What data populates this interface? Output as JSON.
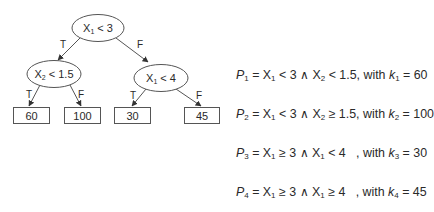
{
  "diagram": {
    "type": "decision-tree",
    "nodes": {
      "root": {
        "var": "X",
        "sub": "1",
        "op": " < ",
        "val": "3"
      },
      "left": {
        "var": "X",
        "sub": "2",
        "op": " < ",
        "val": "1.5"
      },
      "right": {
        "var": "X",
        "sub": "1",
        "op": " < ",
        "val": "4"
      }
    },
    "edges": {
      "root_left": "T",
      "root_right": "F",
      "left_left": "T",
      "left_right": "F",
      "right_left": "T",
      "right_right": "F"
    },
    "leaves": [
      "60",
      "100",
      "30",
      "45"
    ],
    "colors": {
      "stroke": "#555555",
      "text": "#2a2a2a"
    }
  },
  "rules": [
    {
      "p": "P",
      "pi": "1",
      "eq": " = X",
      "a": "1",
      "c1": " < 3 ∧ X",
      "b": "2",
      "c2": " < 1.5",
      "w": ", with ",
      "k": "k",
      "ki": "1",
      "kv": " = 60"
    },
    {
      "p": "P",
      "pi": "2",
      "eq": " = X",
      "a": "1",
      "c1": " < 3 ∧ X",
      "b": "2",
      "c2": " ≥ 1.5",
      "w": ", with ",
      "k": "k",
      "ki": "2",
      "kv": " = 100"
    },
    {
      "p": "P",
      "pi": "3",
      "eq": " = X",
      "a": "1",
      "c1": " ≥ 3 ∧ X",
      "b": "1",
      "c2": " < 4   ",
      "w": ", with ",
      "k": "k",
      "ki": "3",
      "kv": " = 30"
    },
    {
      "p": "P",
      "pi": "4",
      "eq": " = X",
      "a": "1",
      "c1": " ≥ 3 ∧ X",
      "b": "1",
      "c2": " ≥ 4   ",
      "w": ", with ",
      "k": "k",
      "ki": "4",
      "kv": " = 45"
    }
  ]
}
